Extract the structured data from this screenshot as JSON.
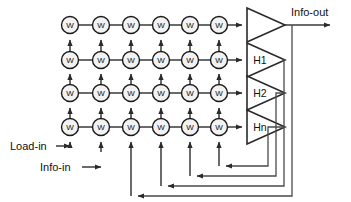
{
  "diagram": {
    "colors": {
      "background": "#ffffff",
      "wire": "#3a3a3a",
      "node_fill": "#f2f2f2",
      "node_stroke": "#1a1a1a",
      "amp_stroke": "#2a2a2a",
      "text": "#101010"
    },
    "grid": {
      "rows": 4,
      "columns": 6,
      "node_label": "W",
      "column_x": [
        70,
        101,
        131,
        161,
        190,
        219
      ],
      "row_y": [
        25,
        60,
        93,
        127
      ],
      "node_radius": 8.5
    },
    "amplifiers": [
      {
        "name": "amp-out",
        "label": "",
        "y": 25
      },
      {
        "name": "amp-h1",
        "label": "H1",
        "y": 60
      },
      {
        "name": "amp-h2",
        "label": "H2",
        "y": 93
      },
      {
        "name": "amp-hn",
        "label": "Hn",
        "y": 127
      }
    ],
    "io": {
      "info_out": "Info-out",
      "load_in": "Load-in",
      "info_in": "Info-in"
    },
    "feedback": {
      "count": 4,
      "bus_x": [
        292,
        284,
        276,
        268
      ],
      "bottom_y": [
        196,
        186,
        176,
        166
      ],
      "target_column_x": [
        101,
        131,
        161,
        190
      ]
    }
  }
}
